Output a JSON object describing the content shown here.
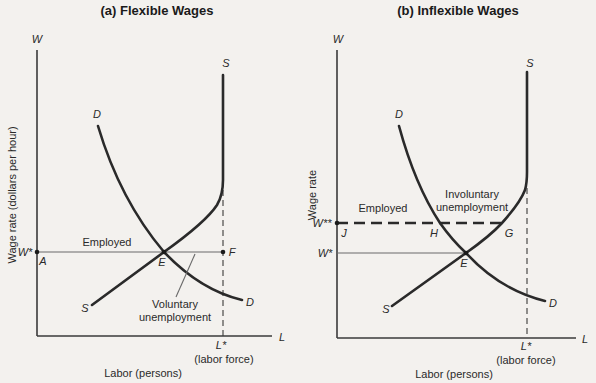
{
  "panel_a": {
    "title": "(a) Flexible Wages",
    "y_axis_symbol": "W",
    "x_axis_symbol": "L",
    "y_axis_label": "Wage rate (dollars per hour)",
    "x_axis_label": "Labor (persons)",
    "supply_label_top": "S",
    "supply_label_bottom": "S",
    "demand_label_top": "D",
    "demand_label_bottom": "D",
    "wage_level": "W*",
    "point_a": "A",
    "point_e": "E",
    "point_f": "F",
    "region_employed": "Employed",
    "region_unemployment_line1": "Voluntary",
    "region_unemployment_line2": "unemployment",
    "labor_force_tick": "L*",
    "labor_force_label": "(labor force)"
  },
  "panel_b": {
    "title": "(b) Inflexible Wages",
    "y_axis_symbol": "W",
    "x_axis_symbol": "L",
    "y_axis_label": "Wage rate",
    "x_axis_label": "Labor (persons)",
    "supply_label_top": "S",
    "supply_label_bottom": "S",
    "demand_label_top": "D",
    "demand_label_bottom": "D",
    "wage_high": "W**",
    "wage_level": "W*",
    "point_j": "J",
    "point_h": "H",
    "point_g": "G",
    "point_e": "E",
    "region_employed": "Employed",
    "region_unemployment_line1": "Involuntary",
    "region_unemployment_line2": "unemployment",
    "labor_force_tick": "L*",
    "labor_force_label": "(labor force)"
  },
  "colors": {
    "background": "#f3f1ee",
    "curve": "#2a2a2a",
    "guide": "#6a6a6a"
  }
}
